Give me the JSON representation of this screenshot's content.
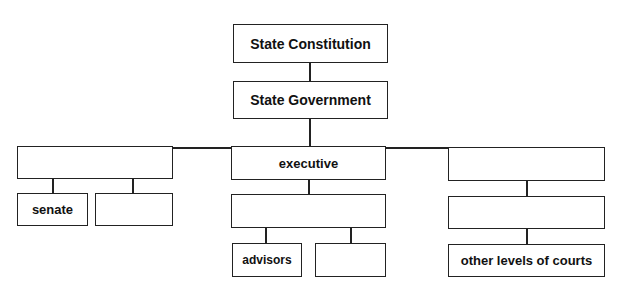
{
  "diagram": {
    "title_box": "State Constitution",
    "government_box": "State Government",
    "branches": {
      "legislative": {
        "label": "",
        "children": [
          "senate",
          ""
        ]
      },
      "executive": {
        "label": "executive",
        "sub": "",
        "children": [
          "advisors",
          ""
        ]
      },
      "judicial": {
        "label": "",
        "sub": "",
        "bottom": "other levels of courts"
      }
    }
  }
}
